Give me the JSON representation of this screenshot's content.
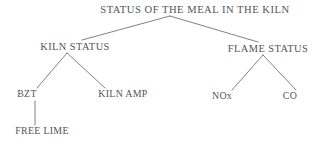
{
  "diagram": {
    "type": "tree",
    "title_text": "STATUS OF THE MEAL IN THE KILN",
    "orientation": "top-down",
    "background_color": "#ffffff",
    "text_color": "#3b3b42",
    "line_color": "#55555c",
    "nodes": [
      {
        "id": "root",
        "label": "STATUS OF THE MEAL IN THE KILN",
        "level": 1,
        "x": 195,
        "y": 13
      },
      {
        "id": "kiln-status",
        "label": "KILN STATUS",
        "level": 2,
        "x": 75,
        "y": 50
      },
      {
        "id": "flame-status",
        "label": "FLAME STATUS",
        "level": 2,
        "x": 268,
        "y": 52
      },
      {
        "id": "bzt",
        "label": "BZT",
        "level": 3,
        "x": 27,
        "y": 97
      },
      {
        "id": "kiln-amp",
        "label": "KILN AMP",
        "level": 3,
        "x": 123,
        "y": 97
      },
      {
        "id": "nox",
        "label": "NOx",
        "level": 3,
        "x": 222,
        "y": 99
      },
      {
        "id": "co",
        "label": "CO",
        "level": 3,
        "x": 290,
        "y": 99
      },
      {
        "id": "free-lime",
        "label": "FREE LIME",
        "level": 4,
        "x": 42,
        "y": 134
      }
    ],
    "edges": [
      {
        "id": "root-to-kiln-status",
        "from": "root",
        "to": "kiln-status",
        "x1": 170,
        "y1": 16,
        "x2": 82,
        "y2": 40
      },
      {
        "id": "root-to-flame-status",
        "from": "root",
        "to": "flame-status",
        "x1": 170,
        "y1": 16,
        "x2": 258,
        "y2": 42
      },
      {
        "id": "kiln-status-to-bzt",
        "from": "kiln-status",
        "to": "bzt",
        "x1": 67,
        "y1": 53,
        "x2": 37,
        "y2": 88
      },
      {
        "id": "kiln-status-to-kiln-amp",
        "from": "kiln-status",
        "to": "kiln-amp",
        "x1": 67,
        "y1": 53,
        "x2": 105,
        "y2": 88
      },
      {
        "id": "flame-status-to-nox",
        "from": "flame-status",
        "to": "nox",
        "x1": 263,
        "y1": 55,
        "x2": 232,
        "y2": 90
      },
      {
        "id": "flame-status-to-co",
        "from": "flame-status",
        "to": "co",
        "x1": 263,
        "y1": 55,
        "x2": 296,
        "y2": 90
      },
      {
        "id": "bzt-to-free-lime",
        "from": "bzt",
        "to": "free-lime",
        "x1": 35,
        "y1": 101,
        "x2": 35,
        "y2": 125
      }
    ]
  }
}
